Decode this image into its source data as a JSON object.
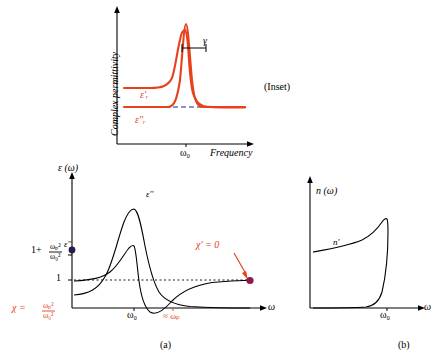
{
  "figure": {
    "panels": [
      {
        "id": "inset",
        "caption": "(Inset)"
      },
      {
        "id": "a",
        "caption": "(a)"
      },
      {
        "id": "b",
        "caption": "(b)"
      }
    ]
  },
  "inset_panel": {
    "label": "(Inset)",
    "y_axis_label": "Complex permittivity",
    "x_axis_label": "Frequency",
    "resonance_tick": "ω₀",
    "gamma_label": "γ",
    "real_part_label": "ε'ᵣ",
    "imag_part_label": "ε''ᵣ",
    "curve_color": "#e8401c",
    "axis_color": "#000000",
    "dashed_color": "#1a2a8a"
  },
  "panel_a": {
    "caption": "(a)",
    "y_axis_label": "ε (ω)",
    "x_axis_label": "ω",
    "imag_curve_label": "ε''",
    "real_curve_label": "ε''",
    "ticks": {
      "one_plus": "1+",
      "ratio_top": "ωₚ²",
      "ratio_bottom": "ω₀²",
      "one": "1"
    },
    "resonance_tick": "ω₀",
    "plasma_tick": "≈ ωₚ",
    "chi_zero_label": "χ' = 0",
    "chi_label": "χ =",
    "chi_ratio_top": "ωₚ²",
    "chi_ratio_bottom": "ω₀²",
    "accent_color": "#e8401c",
    "dot_color": "#8b1a4a"
  },
  "panel_b": {
    "caption": "(b)",
    "y_axis_label": "n (ω)",
    "x_axis_label": "ω",
    "curve_label": "n'",
    "resonance_tick": "ω₀"
  }
}
